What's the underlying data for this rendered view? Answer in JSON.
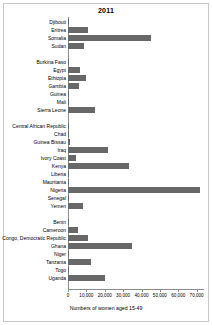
{
  "chart_data": {
    "type": "bar",
    "orientation": "horizontal",
    "title": "2011",
    "xlabel": "Numbers of women aged 15-49",
    "ylabel": "",
    "xlim": [
      0,
      74000
    ],
    "grid": false,
    "legend": null,
    "bar_color": "#686868",
    "xticks": [
      {
        "value": 0,
        "label": "0"
      },
      {
        "value": 10000,
        "label": "10,000"
      },
      {
        "value": 20000,
        "label": "20,000"
      },
      {
        "value": 30000,
        "label": "30,000"
      },
      {
        "value": 40000,
        "label": "40,000"
      },
      {
        "value": 50000,
        "label": "50,000"
      },
      {
        "value": 60000,
        "label": "60,000"
      },
      {
        "value": 70000,
        "label": "70,000"
      }
    ],
    "groups": [
      {
        "name": "group-1",
        "categories": [
          "Djibouti",
          "Eritrea",
          "Somalia",
          "Sudan"
        ],
        "values": [
          400,
          11000,
          45000,
          8500
        ]
      },
      {
        "name": "group-2",
        "categories": [
          "Burkina Faso",
          "Egypt",
          "Ethiopia",
          "Gambia",
          "Guinea",
          "Mali",
          "Sierra Leone"
        ],
        "values": [
          150,
          6500,
          10000,
          6000,
          600,
          300,
          14500
        ]
      },
      {
        "name": "group-3",
        "categories": [
          "Central African Republic",
          "Chad",
          "Guinea Bissau",
          "Iraq",
          "Ivory Coast",
          "Kenya",
          "Liberia",
          "Mauritania",
          "Nigeria",
          "Senegal",
          "Yemen"
        ],
        "values": [
          120,
          150,
          900,
          22000,
          4500,
          33000,
          800,
          200,
          72000,
          600,
          8000
        ]
      },
      {
        "name": "group-4",
        "categories": [
          "Benin",
          "Cameroon",
          "Congo, Democratic Republic",
          "Ghana",
          "Niger",
          "Tanzania",
          "Togo"
        ],
        "values": [
          300,
          5500,
          11000,
          35000,
          150,
          12500,
          500
        ]
      }
    ],
    "categories": [
      "Djibouti",
      "Eritrea",
      "Somalia",
      "Sudan",
      "Burkina Faso",
      "Egypt",
      "Ethiopia",
      "Gambia",
      "Guinea",
      "Mali",
      "Sierra Leone",
      "Central African Republic",
      "Chad",
      "Guinea Bissau",
      "Iraq",
      "Ivory Coast",
      "Kenya",
      "Liberia",
      "Mauritania",
      "Nigeria",
      "Senegal",
      "Yemen",
      "Benin",
      "Cameroon",
      "Congo, Democratic Republic",
      "Ghana",
      "Niger",
      "Tanzania",
      "Togo",
      "Uganda"
    ],
    "values": [
      400,
      11000,
      45000,
      8500,
      150,
      6500,
      10000,
      6000,
      600,
      300,
      14500,
      120,
      150,
      900,
      22000,
      4500,
      33000,
      800,
      200,
      72000,
      600,
      8000,
      300,
      5500,
      11000,
      35000,
      150,
      12500,
      500,
      20000
    ]
  }
}
